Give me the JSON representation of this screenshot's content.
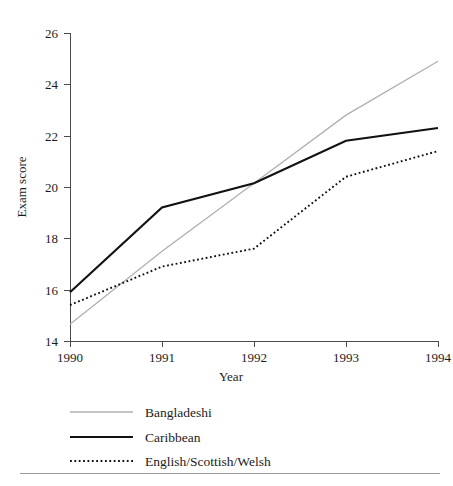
{
  "chart_data": {
    "type": "line",
    "title": "",
    "subtitle": "",
    "xlabel": "Year",
    "ylabel": "Exam score",
    "x": [
      1990,
      1991,
      1992,
      1993,
      1994
    ],
    "xtick_labels": [
      "1990",
      "1991",
      "1992",
      "1993",
      "1994"
    ],
    "ytick_labels": [
      "14",
      "16",
      "18",
      "20",
      "22",
      "24",
      "26"
    ],
    "yticks": [
      14,
      16,
      18,
      20,
      22,
      24,
      26
    ],
    "xlim": [
      1990,
      1994
    ],
    "ylim": [
      14,
      26
    ],
    "grid": false,
    "legend_position": "below-plot",
    "series": [
      {
        "name": "Bangladeshi",
        "values": [
          14.65,
          17.5,
          20.15,
          22.8,
          24.9
        ],
        "color": "#b0b0b0",
        "style": "solid",
        "width": 1.3
      },
      {
        "name": "Caribbean",
        "values": [
          15.9,
          19.2,
          20.15,
          21.8,
          22.3
        ],
        "color": "#111111",
        "style": "solid",
        "width": 2.1
      },
      {
        "name": "English/Scottish/Welsh",
        "values": [
          15.4,
          16.9,
          17.6,
          20.4,
          21.4
        ],
        "color": "#111111",
        "style": "dotted",
        "width": 1.9
      }
    ]
  },
  "legend": {
    "items": [
      {
        "label": "Bangladeshi"
      },
      {
        "label": "Caribbean"
      },
      {
        "label": "English/Scottish/Welsh"
      }
    ]
  },
  "axes": {
    "x_title": "Year",
    "y_title": "Exam score"
  },
  "colors": {
    "bangladeshi": "#b0b0b0",
    "caribbean": "#111111",
    "english_scottish_welsh": "#111111",
    "axis": "#4a4a4a",
    "rule": "#9a9a9a",
    "background": "#ffffff"
  }
}
